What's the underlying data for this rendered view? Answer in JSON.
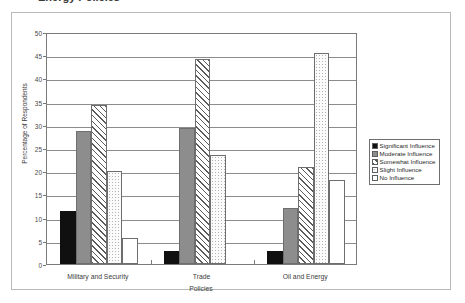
{
  "title": {
    "text": "Energy Policies",
    "note": "cut off at top edge of screenshot"
  },
  "chart_data": {
    "type": "bar",
    "title": "Energy Policies",
    "xlabel": "Policies",
    "ylabel": "Percentage of Respondents",
    "ylim": [
      0,
      50
    ],
    "ytick_step": 5,
    "yticks": [
      "0",
      "5",
      "10",
      "15",
      "20",
      "25",
      "30",
      "35",
      "40",
      "45",
      "50"
    ],
    "grid": true,
    "legend_position": "right",
    "categories": [
      "Military and Security",
      "Trade",
      "Oil and Energy"
    ],
    "series": [
      {
        "name": "Significant Influence",
        "fill": "solid-black",
        "color": "#101010",
        "values": [
          11.4,
          2.8,
          2.9
        ]
      },
      {
        "name": "Moderate Influence",
        "fill": "solid-gray",
        "color": "#8d8d8d",
        "values": [
          28.6,
          29.3,
          12.0
        ]
      },
      {
        "name": "Somewhat Influence",
        "fill": "diagonal-hatch",
        "color": "#5a5a5a",
        "values": [
          34.3,
          44.1,
          21.0
        ]
      },
      {
        "name": "Slight Influence",
        "fill": "dotted",
        "color": "#b5b5b5",
        "values": [
          20.0,
          23.4,
          45.5
        ]
      },
      {
        "name": "No Influence",
        "fill": "white-outline",
        "color": "#ffffff",
        "values": [
          5.6,
          0,
          18.1
        ]
      }
    ]
  },
  "legend": {
    "items": [
      {
        "label": "Significant Influence"
      },
      {
        "label": "Moderate Influence"
      },
      {
        "label": "Somewhat Influence"
      },
      {
        "label": "Slight Influence"
      },
      {
        "label": "No Influence"
      }
    ]
  }
}
